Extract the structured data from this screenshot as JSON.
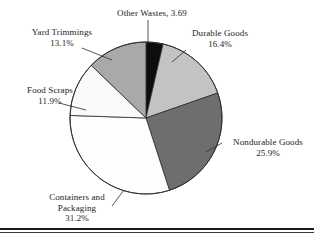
{
  "chart_data": {
    "type": "pie",
    "title": "",
    "legend_position": "outside-labels",
    "categories": [
      "Other Wastes",
      "Durable Goods",
      "Nondurable Goods",
      "Containers and Packaging",
      "Food Scraps",
      "Yard Trimmings"
    ],
    "values": [
      3.69,
      16.4,
      25.9,
      31.2,
      11.9,
      13.1
    ],
    "value_labels": [
      "3.69",
      "16.4%",
      "25.9%",
      "31.2%",
      "11.9%",
      "13.1%"
    ],
    "slice_colors": [
      "#0d0d0d",
      "#c3c3c3",
      "#6e6e6e",
      "#fdfdfd",
      "#fafafa",
      "#a9a9a9"
    ],
    "start_angle_deg": 0,
    "direction": "clockwise",
    "center": {
      "x": 146,
      "y": 118
    },
    "radius": 76
  },
  "labels": {
    "other_wastes": {
      "line1": "Other Wastes, 3.69",
      "name": "Other Wastes",
      "value": "3.69"
    },
    "yard_trimmings": {
      "line1": "Yard Trimmings",
      "line2": "13.1%"
    },
    "durable_goods": {
      "line1": "Durable Goods",
      "line2": "16.4%"
    },
    "food_scraps": {
      "line1": "Food Scraps",
      "line2": "11.9%"
    },
    "nondurable_goods": {
      "line1": "Nondurable Goods",
      "line2": "25.9%"
    },
    "containers_packaging": {
      "line1": "Containers and",
      "line2": "Packaging",
      "line3": "31.2%"
    }
  },
  "colors": {
    "slice_other_wastes": "#0d0d0d",
    "slice_durable_goods": "#c3c3c3",
    "slice_nondurable_goods": "#6e6e6e",
    "slice_containers_packaging": "#fdfdfd",
    "slice_food_scraps": "#fafafa",
    "slice_yard_trimmings": "#a9a9a9",
    "outline": "#2b2b2b",
    "text": "#1c1c1c",
    "rule": "#1a1a1a"
  }
}
